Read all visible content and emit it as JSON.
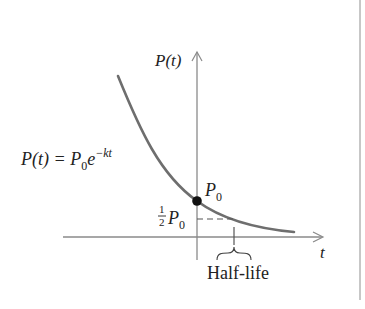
{
  "diagram": {
    "y_axis_label": "P(t)",
    "x_axis_label": "t",
    "equation": {
      "lhs": "P(t) = P",
      "subscript": "0",
      "base": "e",
      "exponent": "−kt"
    },
    "initial_value_label": {
      "main": "P",
      "sub": "0"
    },
    "half_value_label": {
      "num": "1",
      "den": "2",
      "main": "P",
      "sub": "0"
    },
    "half_life_label": "Half-life",
    "colors": {
      "curve": "#6e6e6e",
      "axis": "#8a8a8a",
      "dot": "#111111",
      "text": "#222222"
    }
  }
}
